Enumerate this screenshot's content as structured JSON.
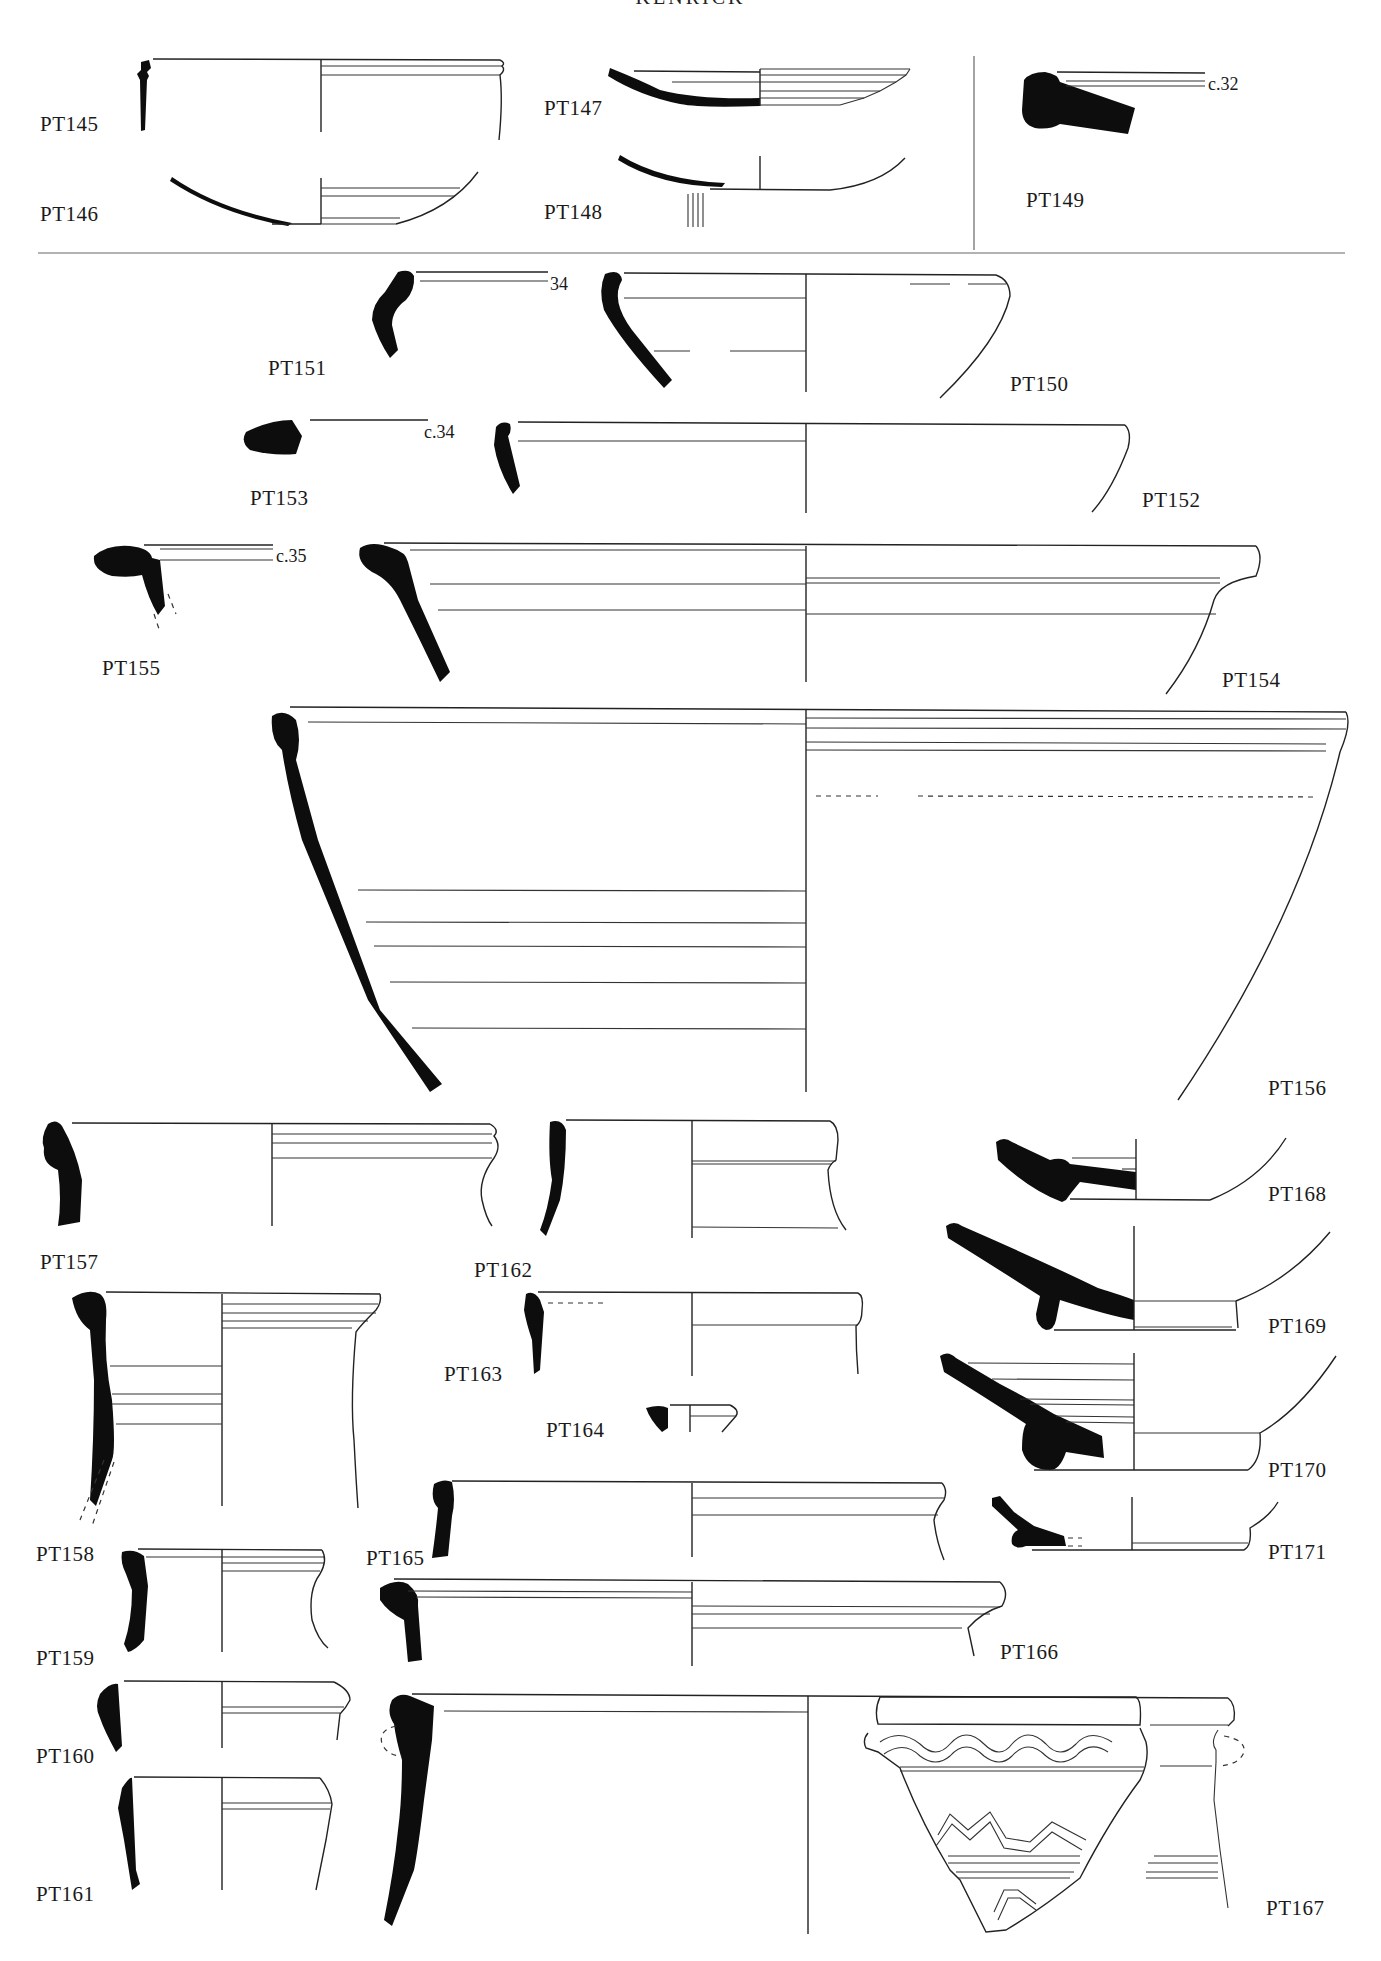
{
  "header": {
    "running_title": "KENRICK"
  },
  "plate": {
    "figures": [
      {
        "id": "PT145",
        "label": "PT145"
      },
      {
        "id": "PT146",
        "label": "PT146"
      },
      {
        "id": "PT147",
        "label": "PT147"
      },
      {
        "id": "PT148",
        "label": "PT148"
      },
      {
        "id": "PT149",
        "label": "PT149",
        "diameter": "c.32"
      },
      {
        "id": "PT150",
        "label": "PT150"
      },
      {
        "id": "PT151",
        "label": "PT151",
        "diameter": "34"
      },
      {
        "id": "PT152",
        "label": "PT152"
      },
      {
        "id": "PT153",
        "label": "PT153",
        "diameter": "c.34"
      },
      {
        "id": "PT154",
        "label": "PT154"
      },
      {
        "id": "PT155",
        "label": "PT155",
        "diameter": "c.35"
      },
      {
        "id": "PT156",
        "label": "PT156"
      },
      {
        "id": "PT157",
        "label": "PT157"
      },
      {
        "id": "PT158",
        "label": "PT158"
      },
      {
        "id": "PT159",
        "label": "PT159"
      },
      {
        "id": "PT160",
        "label": "PT160"
      },
      {
        "id": "PT161",
        "label": "PT161"
      },
      {
        "id": "PT162",
        "label": "PT162"
      },
      {
        "id": "PT163",
        "label": "PT163"
      },
      {
        "id": "PT164",
        "label": "PT164"
      },
      {
        "id": "PT165",
        "label": "PT165"
      },
      {
        "id": "PT166",
        "label": "PT166"
      },
      {
        "id": "PT167",
        "label": "PT167"
      },
      {
        "id": "PT168",
        "label": "PT168"
      },
      {
        "id": "PT169",
        "label": "PT169"
      },
      {
        "id": "PT170",
        "label": "PT170"
      },
      {
        "id": "PT171",
        "label": "PT171"
      }
    ]
  },
  "colors": {
    "ink": "#0d0d0d",
    "line": "#222222",
    "background": "#ffffff"
  }
}
